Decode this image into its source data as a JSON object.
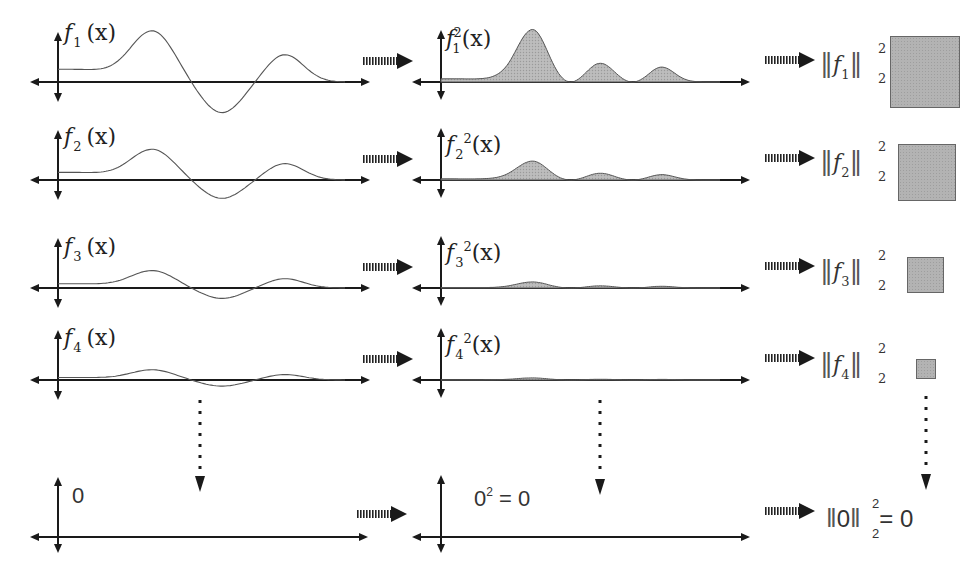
{
  "colors": {
    "axis": "#1a1a1a",
    "curve": "#555555",
    "fill": "#b5b5b5",
    "fill_stroke": "#555555",
    "square_fill": "#b3b3b3",
    "square_border": "#666666",
    "arrow": "#1a1a1a"
  },
  "rows": [
    {
      "id": "f1",
      "func_label": {
        "name": "f",
        "sub": "1",
        "arg": "(x)"
      },
      "square_label": {
        "name": "f",
        "sub": "1",
        "arg": "(x)",
        "sup": "2"
      },
      "norm_label": {
        "name": "f",
        "sub": "1",
        "norm_sub": "2",
        "norm_sup": "2"
      },
      "axis_y": 82,
      "amplitude": 1.0,
      "square_size": 82
    },
    {
      "id": "f2",
      "func_label": {
        "name": "f",
        "sub": "2",
        "arg": "(x)"
      },
      "square_label": {
        "name": "f",
        "sub": "2",
        "arg": "(x)",
        "sup": "2"
      },
      "norm_label": {
        "name": "f",
        "sub": "2",
        "norm_sub": "2",
        "norm_sup": "2"
      },
      "axis_y": 180,
      "amplitude": 0.6,
      "square_size": 58
    },
    {
      "id": "f3",
      "func_label": {
        "name": "f",
        "sub": "3",
        "arg": "(x)"
      },
      "square_label": {
        "name": "f",
        "sub": "3",
        "arg": "(x)",
        "sup": "2"
      },
      "norm_label": {
        "name": "f",
        "sub": "3",
        "norm_sub": "2",
        "norm_sup": "2"
      },
      "axis_y": 288,
      "amplitude": 0.34,
      "square_size": 36
    },
    {
      "id": "f4",
      "func_label": {
        "name": "f",
        "sub": "4",
        "arg": "(x)"
      },
      "square_label": {
        "name": "f",
        "sub": "4",
        "arg": "(x)",
        "sup": "2"
      },
      "norm_label": {
        "name": "f",
        "sub": "4",
        "norm_sub": "2",
        "norm_sup": "2"
      },
      "axis_y": 380,
      "amplitude": 0.2,
      "square_size": 20
    }
  ],
  "limit_row": {
    "func_label": "0",
    "square_label_base": "0",
    "square_label_sup": "2",
    "square_label_rest": " = 0",
    "norm_inner": "0",
    "norm_sub": "2",
    "norm_sup": "2",
    "norm_rest": "= 0",
    "axis_y": 537
  },
  "limit_arrows": {
    "style": "dotted",
    "columns": [
      "functions",
      "squares",
      "norms"
    ]
  }
}
